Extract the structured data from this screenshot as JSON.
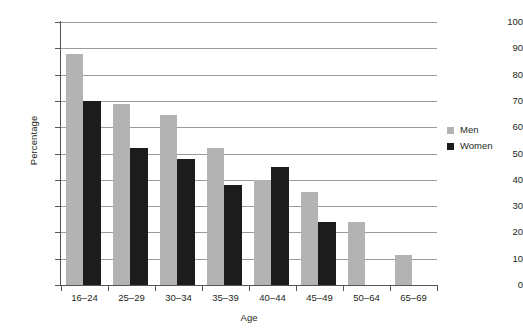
{
  "chart_data": {
    "type": "bar",
    "title": "",
    "subtitle": "",
    "xlabel": "Age",
    "ylabel": "Percentage",
    "categories": [
      "16–24",
      "25–29",
      "30–34",
      "35–39",
      "40–44",
      "45–49",
      "50–64",
      "65–69"
    ],
    "series": [
      {
        "name": "Men",
        "color": "#b3b3b3",
        "values": [
          88,
          69,
          64.5,
          52,
          40,
          35.5,
          24,
          11.5
        ]
      },
      {
        "name": "Women",
        "color": "#1c1c1c",
        "values": [
          70,
          52,
          48,
          38,
          45,
          24,
          null,
          null
        ]
      }
    ],
    "ylim": [
      0,
      100
    ],
    "ytick_labels": [
      "0",
      "10",
      "20",
      "30",
      "40",
      "50",
      "60",
      "70",
      "80",
      "90",
      "100"
    ],
    "ytick_values": [
      0,
      10,
      20,
      30,
      40,
      50,
      60,
      70,
      80,
      90,
      100
    ],
    "grid": "horizontal",
    "legend_position": "right"
  },
  "legend": {
    "entries": [
      {
        "label": "Men",
        "swatch": "#b3b3b3"
      },
      {
        "label": "Women",
        "swatch": "#1c1c1c"
      }
    ]
  },
  "colors": {
    "men": "#b3b3b3",
    "women": "#1c1c1c",
    "gridline": "#9a9a9a",
    "axis": "#555555",
    "text": "#231f20",
    "background": "#ffffff"
  }
}
